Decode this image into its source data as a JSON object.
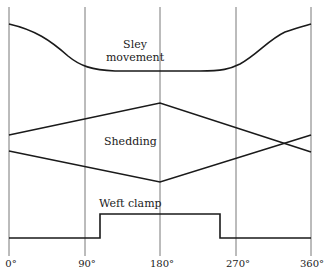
{
  "labels": {
    "sley": [
      "Sley",
      "movement"
    ],
    "shedding": "Shedding",
    "weft_clamp": "Weft clamp"
  },
  "axis": {
    "ticks": [
      "0°",
      "90°",
      "180°",
      "270°",
      "360°"
    ]
  },
  "colors": {
    "line": "#1a1a1a",
    "grid": "#555555",
    "background": "#ffffff"
  }
}
